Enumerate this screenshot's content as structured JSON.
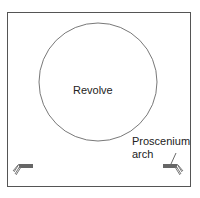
{
  "diagram": {
    "revolve_label": "Revolve",
    "proscenium_label_line1": "Proscenium",
    "proscenium_label_line2": "arch",
    "stroke_color": "#555555"
  }
}
